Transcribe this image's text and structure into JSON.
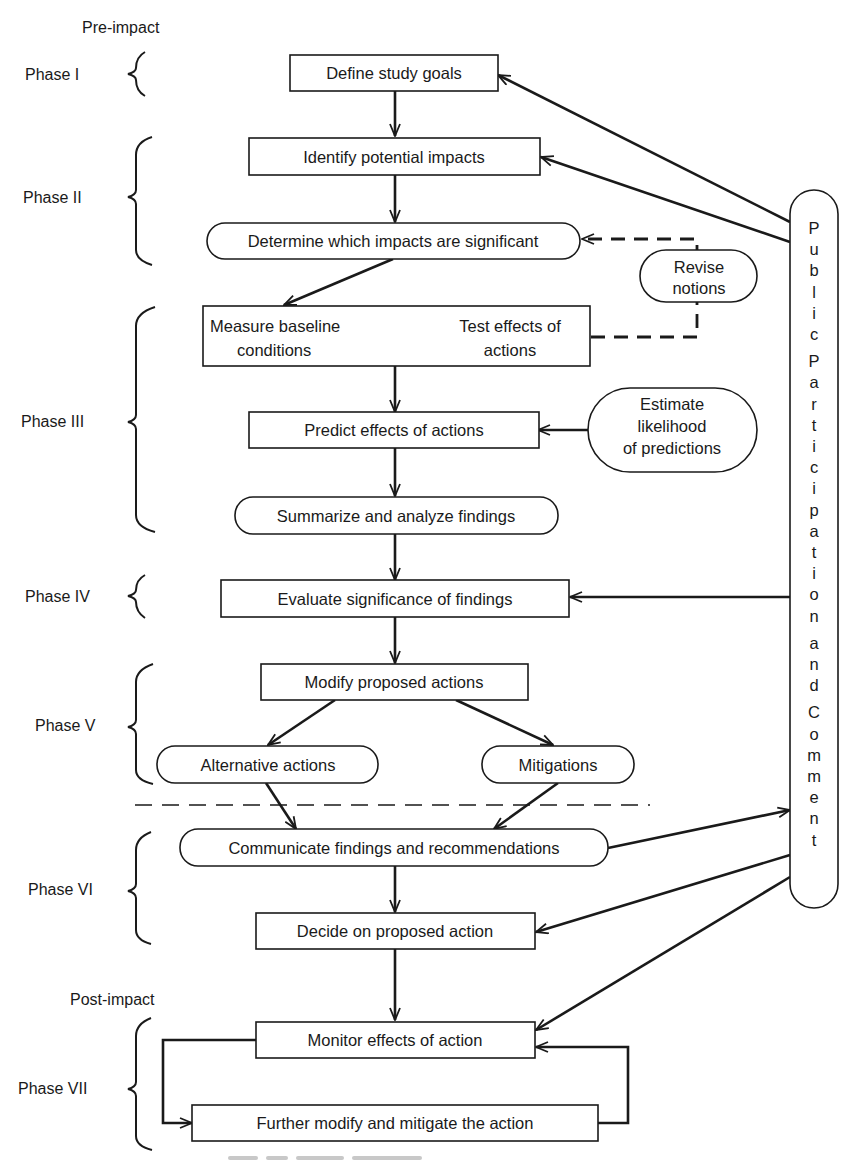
{
  "diagram": {
    "type": "flowchart",
    "section_labels": {
      "pre_impact": "Pre-impact",
      "post_impact": "Post-impact"
    },
    "phases": [
      {
        "id": "phase-1",
        "label": "Phase I"
      },
      {
        "id": "phase-2",
        "label": "Phase II"
      },
      {
        "id": "phase-3",
        "label": "Phase III"
      },
      {
        "id": "phase-4",
        "label": "Phase IV"
      },
      {
        "id": "phase-5",
        "label": "Phase V"
      },
      {
        "id": "phase-6",
        "label": "Phase VI"
      },
      {
        "id": "phase-7",
        "label": "Phase VII"
      }
    ],
    "nodes": {
      "define_goals": {
        "label": "Define study goals",
        "shape": "rect",
        "phase": "Phase I"
      },
      "identify_impacts": {
        "label": "Identify potential impacts",
        "shape": "rect",
        "phase": "Phase II"
      },
      "determine_significant": {
        "label": "Determine which impacts are significant",
        "shape": "rounded",
        "phase": "Phase II"
      },
      "measure_baseline": {
        "line1": "Measure baseline",
        "line2": "conditions",
        "shape": "rect",
        "phase": "Phase III"
      },
      "test_effects": {
        "line1": "Test effects of",
        "line2": "actions",
        "shape": "rect",
        "phase": "Phase III"
      },
      "revise_notions": {
        "line1": "Revise",
        "line2": "notions",
        "shape": "rounded"
      },
      "predict_effects": {
        "label": "Predict effects of actions",
        "shape": "rect",
        "phase": "Phase III"
      },
      "estimate_likelihood": {
        "line1": "Estimate",
        "line2": "likelihood",
        "line3": "of predictions",
        "shape": "rounded"
      },
      "summarize_findings": {
        "label": "Summarize and analyze findings",
        "shape": "rounded",
        "phase": "Phase III"
      },
      "evaluate_significance": {
        "label": "Evaluate significance of findings",
        "shape": "rect",
        "phase": "Phase IV"
      },
      "modify_actions": {
        "label": "Modify proposed actions",
        "shape": "rect",
        "phase": "Phase V"
      },
      "alternative_actions": {
        "label": "Alternative actions",
        "shape": "rounded",
        "phase": "Phase V"
      },
      "mitigations": {
        "label": "Mitigations",
        "shape": "rounded",
        "phase": "Phase V"
      },
      "communicate_findings": {
        "label": "Communicate findings and recommendations",
        "shape": "rounded",
        "phase": "Phase VI"
      },
      "decide_action": {
        "label": "Decide on proposed action",
        "shape": "rect",
        "phase": "Phase VI"
      },
      "monitor_effects": {
        "label": "Monitor effects of action",
        "shape": "rect",
        "phase": "Phase VII"
      },
      "further_modify": {
        "label": "Further modify and mitigate the action",
        "shape": "rect",
        "phase": "Phase VII"
      }
    },
    "public_participation": {
      "label": "Public Participation and Comment",
      "letters": [
        "P",
        "u",
        "b",
        "l",
        "i",
        "c",
        "P",
        "a",
        "r",
        "t",
        "i",
        "c",
        "i",
        "p",
        "a",
        "t",
        "i",
        "o",
        "n",
        "a",
        "n",
        "d",
        "C",
        "o",
        "m",
        "m",
        "e",
        "n",
        "t"
      ]
    },
    "edges": [
      {
        "from": "define_goals",
        "to": "identify_impacts",
        "style": "solid"
      },
      {
        "from": "identify_impacts",
        "to": "determine_significant",
        "style": "solid"
      },
      {
        "from": "determine_significant",
        "to": "measure_baseline",
        "style": "solid"
      },
      {
        "from": "measure_baseline",
        "to": "test_effects",
        "style": "thin"
      },
      {
        "from": "test_effects",
        "to": "determine_significant",
        "via": "revise_notions",
        "style": "dashed"
      },
      {
        "from": "measure_baseline",
        "to": "predict_effects",
        "style": "solid"
      },
      {
        "from": "estimate_likelihood",
        "to": "predict_effects",
        "style": "solid"
      },
      {
        "from": "predict_effects",
        "to": "summarize_findings",
        "style": "solid"
      },
      {
        "from": "summarize_findings",
        "to": "evaluate_significance",
        "style": "solid"
      },
      {
        "from": "evaluate_significance",
        "to": "modify_actions",
        "style": "solid"
      },
      {
        "from": "modify_actions",
        "to": "alternative_actions",
        "style": "solid"
      },
      {
        "from": "modify_actions",
        "to": "mitigations",
        "style": "solid"
      },
      {
        "from": "alternative_actions",
        "to": "communicate_findings",
        "style": "solid"
      },
      {
        "from": "mitigations",
        "to": "communicate_findings",
        "style": "solid"
      },
      {
        "from": "communicate_findings",
        "to": "public_participation",
        "style": "solid"
      },
      {
        "from": "communicate_findings",
        "to": "decide_action",
        "style": "solid"
      },
      {
        "from": "decide_action",
        "to": "monitor_effects",
        "style": "solid"
      },
      {
        "from": "monitor_effects",
        "to": "further_modify",
        "style": "solid"
      },
      {
        "from": "further_modify",
        "to": "monitor_effects",
        "style": "solid"
      },
      {
        "from": "public_participation",
        "to": "define_goals",
        "style": "solid"
      },
      {
        "from": "public_participation",
        "to": "identify_impacts",
        "style": "solid"
      },
      {
        "from": "public_participation",
        "to": "evaluate_significance",
        "style": "solid"
      },
      {
        "from": "public_participation",
        "to": "decide_action",
        "style": "solid"
      },
      {
        "from": "public_participation",
        "to": "monitor_effects",
        "style": "solid"
      }
    ],
    "colors": {
      "ink": "#1a1a1a",
      "background": "#ffffff"
    }
  }
}
